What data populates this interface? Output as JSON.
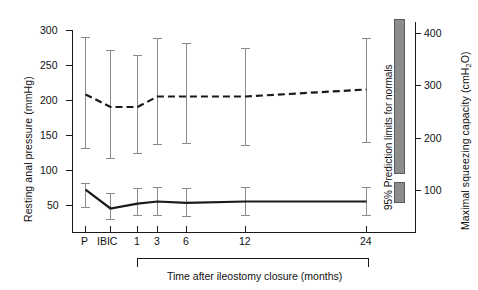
{
  "chart_data": {
    "type": "line",
    "title": "",
    "xlabel": "Time after ileostomy closure (months)",
    "ylabel_left": "Resting anal pressure (mmHg)",
    "ylabel_right": "Maximal squeezing capacity (cmH₂O)",
    "categories": [
      "P",
      "IBIC",
      "1",
      "3",
      "6",
      "12",
      "24"
    ],
    "x_positions": [
      85,
      110,
      137,
      157,
      186,
      245,
      366
    ],
    "ylim_left": [
      0,
      300
    ],
    "yticks_left": [
      300,
      250,
      200,
      150,
      100,
      50
    ],
    "ylim_right": [
      0,
      450
    ],
    "yticks_right": [
      400,
      300,
      200,
      100
    ],
    "grid": false,
    "legend": "none",
    "series": [
      {
        "name": "Maximal squeezing capacity (cmH2O)",
        "axis": "right",
        "style": "dashed",
        "values_left_scale": [
          208,
          190,
          190,
          205,
          205,
          205,
          215
        ],
        "err_low_left_scale": [
          131,
          111,
          119,
          135,
          136,
          134,
          139
        ],
        "err_high_left_scale": [
          290,
          272,
          265,
          288,
          280,
          273,
          288
        ]
      },
      {
        "name": "Resting anal pressure (mmHg)",
        "axis": "left",
        "style": "solid",
        "values_left_scale": [
          72,
          45,
          52,
          55,
          53,
          55,
          55
        ],
        "err_low_left_scale": [
          55,
          28,
          35,
          38,
          36,
          38,
          38
        ],
        "err_high_left_scale": [
          90,
          62,
          70,
          72,
          70,
          72,
          72
        ]
      }
    ],
    "annotations": [
      {
        "name": "95% prediction limits for normals",
        "label": "95% Prediction limits for normals",
        "bars": [
          {
            "for": "maximal-squeezing-capacity",
            "top_value": 305,
            "bottom_value": 93
          },
          {
            "for": "resting-anal-pressure",
            "top_value": 73,
            "bottom_value": 47
          }
        ]
      }
    ],
    "colors": {
      "line": "#1a1a1a",
      "errorbar": "#8a8a8a",
      "prediction_bar": "#8c8c8c",
      "axis": "#1a1a1a",
      "background": "#ffffff"
    }
  },
  "axes": {
    "left": {
      "label": "Resting anal pressure (mmHg)",
      "ticks": [
        "300",
        "250",
        "200",
        "150",
        "100",
        "50"
      ]
    },
    "right": {
      "label_pre": "Maximal squeezing capacity (cmH",
      "label_sub": "2",
      "label_post": "O)",
      "ticks": [
        "400",
        "300",
        "200",
        "100"
      ]
    },
    "bottom": {
      "label": "Time after ileostomy closure (months)",
      "ticks": [
        "P",
        "IBIC",
        "1",
        "3",
        "6",
        "12",
        "24"
      ]
    }
  },
  "prediction": {
    "label": "95% Prediction limits for normals"
  }
}
